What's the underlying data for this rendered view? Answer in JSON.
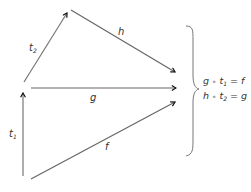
{
  "diagram": {
    "type": "commutative-diagram",
    "arrows": [
      {
        "id": "t1",
        "label": "t",
        "sub": "1"
      },
      {
        "id": "t2",
        "label": "t",
        "sub": "2"
      },
      {
        "id": "h",
        "label": "h"
      },
      {
        "id": "g",
        "label": "g"
      },
      {
        "id": "f",
        "label": "f"
      }
    ],
    "equations": [
      {
        "lhs_a": "g",
        "op": "∘",
        "lhs_b": "t",
        "sub": "1",
        "eq": "=",
        "rhs": "f"
      },
      {
        "lhs_a": "h",
        "op": "∘",
        "lhs_b": "t",
        "sub": "2",
        "eq": "=",
        "rhs": "g"
      }
    ],
    "colors": {
      "line": "#666666",
      "arrowhead": "#111111",
      "text": "#333333"
    }
  }
}
